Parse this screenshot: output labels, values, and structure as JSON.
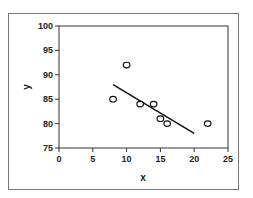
{
  "chart_data": {
    "type": "scatter",
    "title": "",
    "xlabel": "x",
    "ylabel": "y",
    "xlim": [
      0,
      25
    ],
    "ylim": [
      75,
      100
    ],
    "x_ticks": [
      0,
      5,
      10,
      15,
      20,
      25
    ],
    "y_ticks": [
      75,
      80,
      85,
      90,
      95,
      100
    ],
    "grid": false,
    "legend": "none",
    "series": [
      {
        "name": "data",
        "marker": "open-circle",
        "points": [
          {
            "x": 8,
            "y": 85
          },
          {
            "x": 10,
            "y": 92
          },
          {
            "x": 12,
            "y": 84
          },
          {
            "x": 14,
            "y": 84
          },
          {
            "x": 15,
            "y": 81
          },
          {
            "x": 16,
            "y": 80
          },
          {
            "x": 22,
            "y": 80
          }
        ]
      }
    ],
    "trendline": {
      "type": "linear",
      "from": {
        "x": 8,
        "y": 88
      },
      "to": {
        "x": 20,
        "y": 78
      }
    }
  }
}
